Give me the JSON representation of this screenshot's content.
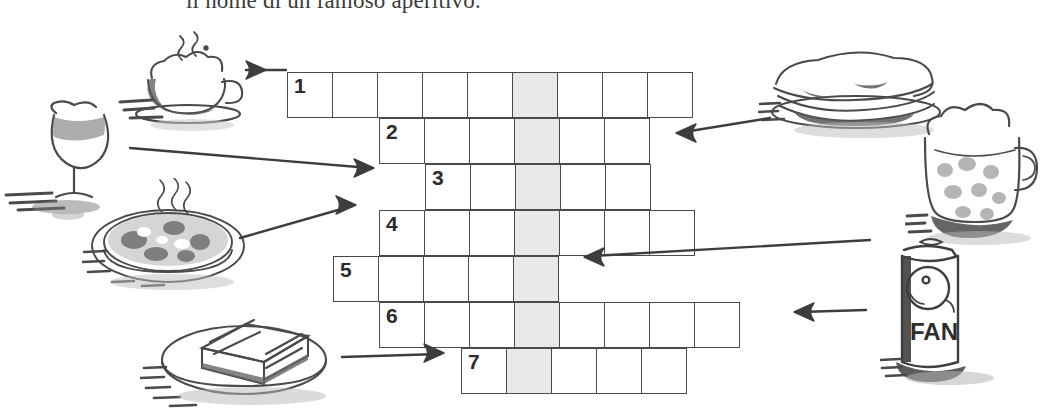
{
  "worksheet": {
    "instruction": "il nome di un famoso aperitivo.",
    "language": "Italian"
  },
  "crossword": {
    "cell_size": 46,
    "highlight_column_index": 5,
    "highlight_color": "#e9e9e9",
    "border_color": "#4a4a4a",
    "rows": [
      {
        "number": "1",
        "start_col": 0,
        "length": 9,
        "x": 287,
        "y": 72
      },
      {
        "number": "2",
        "start_col": 2,
        "length": 6,
        "x": 379,
        "y": 118
      },
      {
        "number": "3",
        "start_col": 3,
        "length": 5,
        "x": 425,
        "y": 164
      },
      {
        "number": "4",
        "start_col": 2,
        "length": 7,
        "x": 379,
        "y": 210
      },
      {
        "number": "5",
        "start_col": 1,
        "length": 5,
        "x": 333,
        "y": 256
      },
      {
        "number": "6",
        "start_col": 2,
        "length": 8,
        "x": 379,
        "y": 302
      },
      {
        "number": "7",
        "start_col": 4,
        "length": 5,
        "x": 461,
        "y": 348
      }
    ]
  },
  "illustrations": [
    {
      "name": "cappuccino-cup-illustration",
      "label": "cappuccino",
      "x": 118,
      "y": 30,
      "w": 140,
      "h": 100
    },
    {
      "name": "wine-glass-illustration",
      "label": "vino",
      "x": 4,
      "y": 95,
      "w": 130,
      "h": 120
    },
    {
      "name": "pizza-illustration",
      "label": "pizza",
      "x": 82,
      "y": 178,
      "w": 172,
      "h": 120
    },
    {
      "name": "toast-sandwich-illustration",
      "label": "toast",
      "x": 140,
      "y": 296,
      "w": 200,
      "h": 115
    },
    {
      "name": "panino-illustration",
      "label": "panino",
      "x": 758,
      "y": 50,
      "w": 190,
      "h": 90
    },
    {
      "name": "beer-mug-illustration",
      "label": "birra",
      "x": 905,
      "y": 98,
      "w": 130,
      "h": 140
    },
    {
      "name": "soda-can-illustration",
      "label": "aranciata",
      "x": 880,
      "y": 232,
      "w": 110,
      "h": 160,
      "can_text": "FAN"
    }
  ],
  "arrows": [
    {
      "name": "arrow-cappuccino-to-row1",
      "points": "246,70 286,70",
      "head_x": 266,
      "head_y": 70,
      "dir": "right"
    },
    {
      "name": "arrow-wine-to-row3",
      "points": "130,148 370,168",
      "head_x": 374,
      "head_y": 168,
      "dir": "right"
    },
    {
      "name": "arrow-pizza-to-row4",
      "points": "240,238 352,206",
      "head_x": 356,
      "head_y": 205,
      "dir": "right"
    },
    {
      "name": "arrow-toast-to-row7",
      "points": "342,357 440,354",
      "head_x": 444,
      "head_y": 353,
      "dir": "right"
    },
    {
      "name": "arrow-panino-to-row2",
      "points": "770,118 684,132",
      "head_x": 676,
      "head_y": 133,
      "dir": "left"
    },
    {
      "name": "arrow-can-to-row5",
      "points": "870,240 592,256",
      "head_x": 584,
      "head_y": 257,
      "dir": "left"
    },
    {
      "name": "arrow-beermug-to-row6",
      "points": "866,310 800,312",
      "head_x": 794,
      "head_y": 312,
      "dir": "left"
    }
  ]
}
